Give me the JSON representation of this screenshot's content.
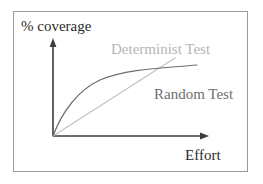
{
  "figure": {
    "title_visible": false,
    "frame": {
      "border_color": "#9a9a9a",
      "background": "#ffffff"
    }
  },
  "axes": {
    "y_label": "% coverage",
    "x_label": "Effort",
    "axis_color": "#3d3d3d",
    "origin": {
      "x": 53,
      "y": 136
    },
    "y_top": {
      "x": 53,
      "y": 39
    },
    "x_right": {
      "x": 208,
      "y": 136
    }
  },
  "curves": [
    {
      "name": "Random Test",
      "label": "Random Test",
      "color": "#6e6e6e",
      "shape": "concave-increasing",
      "description": "Rises steeply from the origin then flattens toward the right",
      "points": [
        {
          "x": 53,
          "y": 136
        },
        {
          "x": 62,
          "y": 116
        },
        {
          "x": 72,
          "y": 100
        },
        {
          "x": 84,
          "y": 88
        },
        {
          "x": 98,
          "y": 80
        },
        {
          "x": 118,
          "y": 75
        },
        {
          "x": 142,
          "y": 71
        },
        {
          "x": 170,
          "y": 68
        },
        {
          "x": 197,
          "y": 65
        }
      ]
    },
    {
      "name": "Determinist Test",
      "label": "Determinist Test",
      "color": "#c2c2c2",
      "shape": "straight-line",
      "description": "Straight line from the origin rising steadily and crossing the random curve",
      "points": [
        {
          "x": 53,
          "y": 136
        },
        {
          "x": 175,
          "y": 58
        }
      ]
    }
  ],
  "annotations": {
    "crossing_point": {
      "x": 130,
      "y": 82,
      "description": "Determinist line crosses Random curve"
    }
  },
  "legend": {
    "position": "inline-labels",
    "entries": [
      {
        "label": "Determinist Test",
        "color": "#b6b6b6"
      },
      {
        "label": "Random Test",
        "color": "#6e6e6e"
      }
    ]
  }
}
